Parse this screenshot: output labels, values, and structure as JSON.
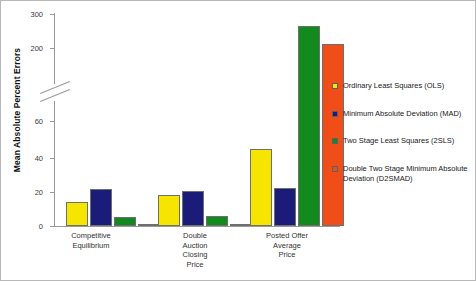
{
  "chart_data": {
    "type": "bar",
    "title": "",
    "xlabel": "",
    "ylabel": "Mean Absolute Percent Errors",
    "ylim": [
      0,
      300
    ],
    "y_axis_break": true,
    "y_axis_break_between": [
      60,
      200
    ],
    "yticks": [
      0,
      20,
      40,
      60,
      200,
      300
    ],
    "ytick_labels": [
      "0",
      "20",
      "40",
      "60",
      "200",
      "300"
    ],
    "grid": false,
    "legend_position": "right",
    "categories": [
      "Competitive\nEquilibrium",
      "Double\nAuction\nClosing\nPrice",
      "Posted Offer\nAverage\nPrice"
    ],
    "series": [
      {
        "name": "Ordinary Least Squares (OLS)",
        "color": "#f6e500",
        "values": [
          14,
          18,
          44
        ]
      },
      {
        "name": "Minimum Absolute Deviation (MAD)",
        "color": "#1b1b7a",
        "values": [
          21,
          20,
          22
        ]
      },
      {
        "name": "Two Stage Least Squares (2SLS)",
        "color": "#138a1d",
        "values": [
          5,
          6,
          265
        ]
      },
      {
        "name": "Double Two Stage Minimum Absolute\nDeviation (D2SMAD)",
        "color": "#f04d18",
        "values": [
          1,
          1,
          212
        ]
      }
    ]
  },
  "colors": {
    "axis": "#9a9a9a",
    "text": "#333333",
    "border": "#b8b8b8",
    "background": "#ffffff"
  }
}
